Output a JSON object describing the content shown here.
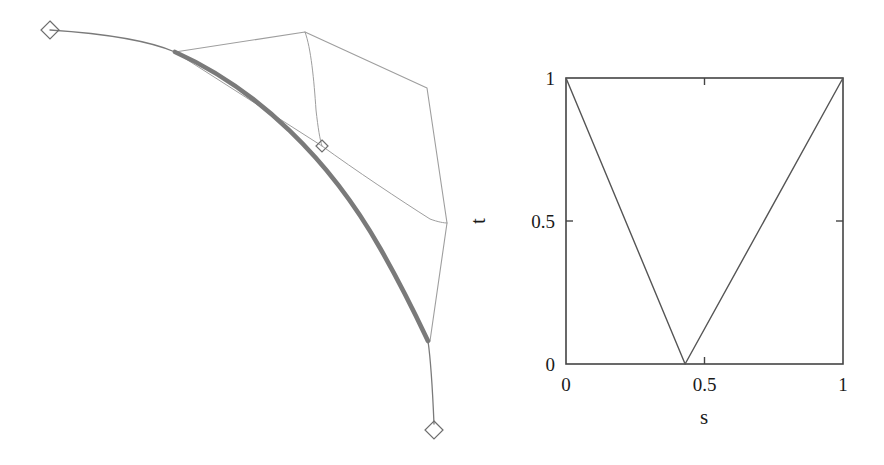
{
  "figure": {
    "title": "",
    "panels": [
      {
        "name": "bezier-curve-panel",
        "description": "Planar curve with control polygon and endpoint markers"
      },
      {
        "name": "parameter-domain-panel",
        "description": "Unit square (s,t) parameter domain with V-shaped polyline"
      }
    ]
  },
  "left_panel": {
    "curve_color": "#7a7a7a",
    "polygon_color": "#9e9e9e",
    "marker_color": "#6e6e6e",
    "markers": [
      {
        "name": "start-endpoint-marker",
        "shape": "diamond",
        "x": 50,
        "y": 30,
        "size": 9
      },
      {
        "name": "interior-knot-marker",
        "shape": "diamond",
        "x": 322,
        "y": 146,
        "size": 6
      },
      {
        "name": "end-endpoint-marker",
        "shape": "diamond",
        "x": 434,
        "y": 430,
        "size": 9
      }
    ],
    "thin_curve_path": "M 50,30 C 110,34 152,42 175,52",
    "thick_curve_path": "M 175,52 C 258,89 330,160 380,248 C 404,290 419,322 428,341",
    "thin_tail_path": "M 428,341 C 431,362 433,400 434,424",
    "polygon_path": "M 175,52 L 305,32 L 427,88 L 447,223 L 430,341",
    "inner_line_upper_path": "M 305,32 C 311,48 314,80 316,110 C 318,128 320,140 322,146",
    "inner_line_lower_path": "M 322,146 C 355,170 400,200 430,219 C 438,222 444,223 447,223",
    "spur_to_knot_path": "M 175,52 L 322,146"
  },
  "chart_data": {
    "type": "line",
    "title": "",
    "xlabel": "s",
    "ylabel": "t",
    "xlim": [
      0,
      1
    ],
    "ylim": [
      0,
      1
    ],
    "grid": false,
    "legend": null,
    "x_ticks": [
      {
        "value": 0,
        "label": "0"
      },
      {
        "value": 0.5,
        "label": "0.5"
      },
      {
        "value": 1,
        "label": "1"
      }
    ],
    "y_ticks": [
      {
        "value": 0,
        "label": "0"
      },
      {
        "value": 0.5,
        "label": "0.5"
      },
      {
        "value": 1,
        "label": "1"
      }
    ],
    "series": [
      {
        "name": "parameter-correspondence",
        "color": "#555555",
        "x": [
          0.0,
          0.43,
          1.0
        ],
        "y": [
          1.0,
          0.0,
          1.0
        ]
      }
    ],
    "box_color": "#444444"
  }
}
